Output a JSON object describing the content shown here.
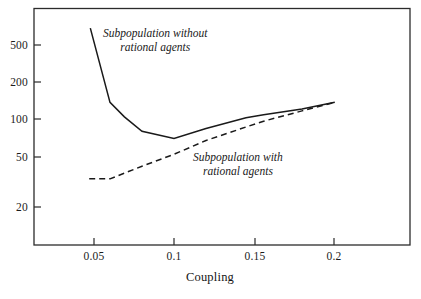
{
  "chart_data": {
    "type": "line",
    "title": "",
    "subtitle": "",
    "xlabel": "Coupling",
    "ylabel": "",
    "xscale": "linear",
    "yscale": "log",
    "xlim": [
      0.03,
      0.2355
    ],
    "ylim": [
      11.0,
      900.0
    ],
    "grid": false,
    "legend_position": "inline-annotations",
    "xticks": [
      0.05,
      0.1,
      0.15,
      0.2
    ],
    "xtick_labels": [
      "0.05",
      "0.1",
      "0.15",
      "0.2"
    ],
    "yticks": [
      20,
      50,
      100,
      200,
      500
    ],
    "ytick_labels": [
      "20",
      "50",
      "100",
      "200",
      "500"
    ],
    "series": [
      {
        "name": "Subpopulation without rational agents",
        "style": "solid",
        "color": "#1a1a1a",
        "annotation": [
          "Subpopulation without",
          "rational agents"
        ],
        "x": [
          0.0477,
          0.06,
          0.069,
          0.08,
          0.1,
          0.12,
          0.145,
          0.156,
          0.18,
          0.2005
        ],
        "y": [
          700,
          160,
          120,
          90,
          78,
          95,
          118,
          125,
          140,
          160
        ]
      },
      {
        "name": "Subpopulation with rational agents",
        "style": "dashed",
        "color": "#1a1a1a",
        "annotation": [
          "Subpopulation with",
          "rational agents"
        ],
        "x": [
          0.047,
          0.06,
          0.08,
          0.1,
          0.12,
          0.145,
          0.156,
          0.18,
          0.2005
        ],
        "y": [
          35,
          35,
          45,
          57,
          75,
          98,
          110,
          135,
          160
        ]
      }
    ],
    "annotations": [
      {
        "id": "without-rational-agents",
        "lines": [
          "Subpopulation without",
          "rational agents"
        ],
        "x": 0.0625,
        "y": 430
      },
      {
        "id": "with-rational-agents",
        "lines": [
          "Subpopulation with",
          "rational agents"
        ],
        "x": 0.1265,
        "y": 45
      }
    ]
  },
  "axes": {
    "frame_color": "#2b2b2b",
    "x_axis_title": "Coupling",
    "y_tick_labels": [
      "500",
      "200",
      "100",
      "50",
      "20"
    ],
    "x_tick_labels": [
      "0.05",
      "0.1",
      "0.15",
      "0.2"
    ]
  },
  "annotations": {
    "without": {
      "line1": "Subpopulation without",
      "line2": "rational agents"
    },
    "with": {
      "line1": "Subpopulation with",
      "line2": "rational agents"
    }
  }
}
